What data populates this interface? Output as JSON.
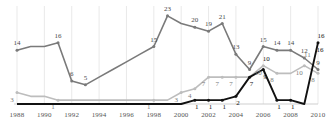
{
  "chart_data": {
    "type": "line",
    "title": "",
    "subtitle": "",
    "xlabel": "",
    "ylabel": "",
    "grid": "vertical-only",
    "legend": "none",
    "xlim": [
      1988,
      2010
    ],
    "ylim": [
      0,
      24
    ],
    "x": [
      1988,
      1989,
      1990,
      1991,
      1992,
      1993,
      1994,
      1995,
      1996,
      1997,
      1998,
      1999,
      2000,
      2001,
      2002,
      2003,
      2004,
      2005,
      2006,
      2007,
      2008,
      2009,
      2010
    ],
    "tick_labels": [
      "1988",
      "1990",
      "1992",
      "1994",
      "1996",
      "1998",
      "2000",
      "2002",
      "2004",
      "2006",
      "2008",
      "2010"
    ],
    "tick_values": [
      1988,
      1990,
      1992,
      1994,
      1996,
      1998,
      2000,
      2002,
      2004,
      2006,
      2008,
      2010
    ],
    "series": [
      {
        "name": "series-dark-gray",
        "color": "#7a7a7a",
        "marker": "circle",
        "values": [
          14,
          15,
          15,
          16,
          6,
          5,
          7,
          9,
          11,
          13,
          15,
          23,
          21,
          20,
          19,
          21,
          13,
          9,
          15,
          14,
          14,
          12,
          9
        ],
        "labels": [
          "14",
          "",
          "",
          "16",
          "6",
          "5",
          "",
          "",
          "",
          "",
          "15",
          "23",
          "",
          "20",
          "19",
          "21",
          "13",
          "9",
          "15",
          "14",
          "14",
          "12",
          "9"
        ]
      },
      {
        "name": "series-light-gray",
        "color": "#bdbdbd",
        "marker": "circle",
        "values": [
          3,
          2,
          2,
          1,
          1,
          1,
          1,
          1,
          1,
          1,
          1,
          1,
          3,
          4,
          7,
          7,
          7,
          7,
          10,
          8,
          8,
          10,
          8
        ],
        "labels": [
          "3",
          "",
          "",
          "1",
          "",
          "",
          "",
          "",
          "",
          "",
          "1",
          "",
          "3",
          "4",
          "7",
          "7",
          "7",
          "",
          "10",
          "8",
          "",
          "10",
          "8"
        ]
      },
      {
        "name": "series-black",
        "color": "#111111",
        "marker": "circle",
        "values": [
          0,
          0,
          0,
          0,
          0,
          0,
          0,
          0,
          0,
          0,
          0,
          0,
          0,
          1,
          1,
          1,
          2,
          7,
          9,
          1,
          1,
          0,
          16
        ],
        "labels": [
          "",
          "",
          "",
          "",
          "",
          "",
          "",
          "",
          "",
          "",
          "",
          "",
          "",
          "1",
          "1",
          "1",
          "2",
          "7",
          "9",
          "1",
          "1",
          "",
          "16"
        ]
      }
    ],
    "extra_labels": [
      {
        "text": "10",
        "x": 2006,
        "y": 10,
        "series": "series-black"
      },
      {
        "text": "11",
        "x": 2009,
        "y": 11,
        "series": "series-light-gray"
      },
      {
        "text": "16",
        "x": 2010,
        "y": 16,
        "series": "series-black"
      }
    ]
  }
}
